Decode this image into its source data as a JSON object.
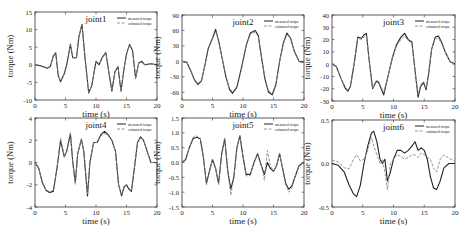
{
  "figure": {
    "legend": {
      "measured": "measured torque",
      "estimated": "estimated torque"
    },
    "colors": {
      "measured": "#222222",
      "estimated": "#8a8a8a",
      "axis": "#333333"
    }
  },
  "chart_data": [
    {
      "type": "line",
      "title": "joint1",
      "xlabel": "time (s)",
      "ylabel": "torque (Nm)",
      "xlim": [
        0,
        20
      ],
      "ylim": [
        -10,
        15
      ],
      "xticks": [
        0,
        5,
        10,
        15,
        20
      ],
      "yticks": [
        -10,
        -5,
        0,
        5,
        10,
        15
      ],
      "box": {
        "x": 35,
        "y": 12,
        "w": 122,
        "h": 88
      },
      "series": [
        {
          "name": "measured torque",
          "x": [
            0,
            1,
            2,
            2.5,
            3,
            3.4,
            3.8,
            4.2,
            4.8,
            5.2,
            5.8,
            6.2,
            6.8,
            7.2,
            7.7,
            8.2,
            8.8,
            9.3,
            10,
            10.5,
            11,
            11.6,
            12.1,
            12.6,
            13.1,
            13.6,
            14.1,
            14.6,
            15,
            15.5,
            16,
            16.5,
            17,
            17.5,
            18,
            19,
            20
          ],
          "y": [
            0,
            -0.3,
            -1,
            -0.5,
            2.5,
            3.4,
            -3,
            -4.8,
            -2.5,
            0,
            5.8,
            2,
            2,
            8,
            11.5,
            2,
            -8,
            -6,
            1,
            0,
            2,
            3.5,
            -2,
            -7.5,
            -2,
            -0.5,
            -7.5,
            -1,
            3,
            5.8,
            4,
            -3.8,
            0.5,
            1,
            0,
            0.3,
            0
          ]
        },
        {
          "name": "estimated torque",
          "x": [
            0,
            1,
            2,
            2.5,
            3,
            3.4,
            3.8,
            4.2,
            4.8,
            5.2,
            5.8,
            6.2,
            6.8,
            7.2,
            7.7,
            8.2,
            8.8,
            9.3,
            10,
            10.5,
            11,
            11.6,
            12.1,
            12.6,
            13.1,
            13.6,
            14.1,
            14.6,
            15,
            15.5,
            16,
            16.5,
            17,
            17.5,
            18,
            19,
            20
          ],
          "y": [
            0,
            -0.3,
            -0.8,
            -0.5,
            2.3,
            3.2,
            -3,
            -4.6,
            -2.5,
            0,
            5.6,
            2,
            2,
            8,
            11.3,
            2,
            -7.8,
            -6,
            1,
            0,
            2,
            3.2,
            -2,
            -7.3,
            -2,
            -0.5,
            -7.3,
            -1,
            3,
            5.6,
            4,
            -3.6,
            0.5,
            0.8,
            0,
            0.3,
            0
          ]
        }
      ]
    },
    {
      "type": "line",
      "title": "joint2",
      "xlabel": "time (s)",
      "ylabel": "torque (Nm)",
      "xlim": [
        0,
        20
      ],
      "ylim": [
        -75,
        90
      ],
      "xticks": [
        0,
        5,
        10,
        15,
        20
      ],
      "yticks": [
        -60,
        -30,
        0,
        30,
        60,
        90
      ],
      "box": {
        "x": 182,
        "y": 15,
        "w": 122,
        "h": 85
      },
      "series": [
        {
          "name": "measured torque",
          "x": [
            0,
            0.8,
            1.5,
            2,
            2.6,
            3.2,
            3.8,
            4.3,
            5,
            5.5,
            6,
            6.6,
            7.2,
            7.8,
            8.3,
            9,
            9.8,
            10.5,
            11.2,
            12,
            12.5,
            13,
            13.6,
            14.2,
            14.8,
            15.4,
            16,
            16.6,
            17.2,
            17.8,
            18.4,
            19.2,
            20
          ],
          "y": [
            0,
            -2,
            -20,
            -35,
            -45,
            -38,
            -5,
            25,
            45,
            62,
            40,
            5,
            -30,
            -55,
            -62,
            -50,
            -10,
            30,
            55,
            60,
            50,
            10,
            -35,
            -60,
            -65,
            -45,
            0,
            35,
            55,
            45,
            20,
            0,
            -2
          ]
        },
        {
          "name": "estimated torque",
          "x": [
            0,
            0.8,
            1.5,
            2,
            2.6,
            3.2,
            3.8,
            4.3,
            5,
            5.5,
            6,
            6.6,
            7.2,
            7.8,
            8.3,
            9,
            9.8,
            10.5,
            11.2,
            12,
            12.5,
            13,
            13.6,
            14.2,
            14.8,
            15.4,
            16,
            16.6,
            17.2,
            17.8,
            18.4,
            19.2,
            20
          ],
          "y": [
            0,
            -2,
            -20,
            -34,
            -43,
            -37,
            -5,
            25,
            44,
            58,
            40,
            5,
            -30,
            -53,
            -59,
            -49,
            -10,
            30,
            52,
            57,
            48,
            10,
            -34,
            -57,
            -62,
            -44,
            0,
            34,
            53,
            44,
            20,
            0,
            -2
          ]
        }
      ]
    },
    {
      "type": "line",
      "title": "joint3",
      "xlabel": "time (s)",
      "ylabel": "torque (Nm)",
      "xlim": [
        0,
        20
      ],
      "ylim": [
        -30,
        40
      ],
      "xticks": [
        0,
        5,
        10,
        15,
        20
      ],
      "yticks": [
        -30,
        -20,
        -10,
        0,
        10,
        20,
        30,
        40
      ],
      "box": {
        "x": 332,
        "y": 15,
        "w": 123,
        "h": 86
      },
      "series": [
        {
          "name": "measured torque",
          "x": [
            0,
            0.7,
            1.5,
            2.2,
            2.6,
            3,
            3.6,
            4.2,
            4.8,
            5.2,
            5.6,
            6,
            6.6,
            7.2,
            7.6,
            8,
            8.4,
            9,
            9.8,
            10.5,
            11.2,
            11.8,
            12.4,
            13,
            13.5,
            14,
            14.4,
            14.9,
            15.3,
            15.7,
            16.2,
            16.8,
            17.3,
            17.8,
            18.4,
            19.2,
            20
          ],
          "y": [
            0,
            -2,
            -12,
            -20,
            -22,
            -18,
            0,
            22,
            21,
            24,
            25,
            5,
            -20,
            -14,
            -15,
            -20,
            -25,
            -12,
            5,
            16,
            22,
            25,
            20,
            18,
            -5,
            -27,
            -18,
            -15,
            -21,
            -8,
            12,
            22,
            23,
            18,
            10,
            2,
            0
          ]
        },
        {
          "name": "estimated torque",
          "x": [
            0,
            0.7,
            1.5,
            2.2,
            2.6,
            3,
            3.6,
            4.2,
            4.8,
            5.2,
            5.6,
            6,
            6.6,
            7.2,
            7.6,
            8,
            8.4,
            9,
            9.8,
            10.5,
            11.2,
            11.8,
            12.4,
            13,
            13.5,
            14,
            14.4,
            14.9,
            15.3,
            15.7,
            16.2,
            16.8,
            17.3,
            17.8,
            18.4,
            19.2,
            20
          ],
          "y": [
            0,
            -2,
            -12,
            -19,
            -21,
            -18,
            0,
            21,
            20,
            22,
            23,
            5,
            -20,
            -13,
            -14,
            -19,
            -23,
            -12,
            5,
            15,
            20,
            23,
            19,
            17,
            -5,
            -25,
            -17,
            -14,
            -20,
            -8,
            12,
            21,
            21,
            17,
            10,
            2,
            0
          ]
        }
      ]
    },
    {
      "type": "line",
      "title": "joint4",
      "xlabel": "time (s)",
      "ylabel": "torque (Nm)",
      "xlim": [
        0,
        20
      ],
      "ylim": [
        -4,
        4
      ],
      "xticks": [
        0,
        5,
        10,
        15,
        20
      ],
      "yticks": [
        -4,
        -2,
        0,
        2,
        4
      ],
      "box": {
        "x": 35,
        "y": 118,
        "w": 122,
        "h": 89
      },
      "series": [
        {
          "name": "measured torque",
          "x": [
            0,
            0.6,
            1.2,
            1.8,
            2.4,
            3,
            3.6,
            4.2,
            4.8,
            5.2,
            5.8,
            6.2,
            6.6,
            7,
            7.6,
            8,
            8.6,
            9,
            9.6,
            10.2,
            10.8,
            11.4,
            12,
            12.6,
            13.2,
            13.7,
            14.2,
            14.6,
            15,
            15.4,
            15.8,
            16.3,
            16.8,
            17.3,
            17.8,
            18.4,
            19,
            20
          ],
          "y": [
            0,
            -0.5,
            -1.8,
            -2.5,
            -2.7,
            -2.6,
            -0.5,
            2,
            0.5,
            1,
            2.6,
            0,
            -1.8,
            0.8,
            2.1,
            1,
            -3,
            0,
            1.8,
            1.8,
            2.5,
            2.8,
            2.5,
            2,
            1,
            -2,
            -3,
            -2.2,
            -2,
            -2.4,
            -2.6,
            -0.5,
            1.8,
            2.3,
            2,
            1,
            0,
            0
          ]
        },
        {
          "name": "estimated torque",
          "x": [
            0,
            0.6,
            1.2,
            1.8,
            2.4,
            3,
            3.6,
            4.2,
            4.8,
            5.2,
            5.8,
            6.2,
            6.6,
            7,
            7.6,
            8,
            8.6,
            9,
            9.6,
            10.2,
            10.8,
            11.4,
            12,
            12.6,
            13.2,
            13.7,
            14.2,
            14.6,
            15,
            15.4,
            15.8,
            16.3,
            16.8,
            17.3,
            17.8,
            18.4,
            19,
            20
          ],
          "y": [
            0,
            -0.5,
            -1.8,
            -2.5,
            -2.6,
            -2.5,
            -0.5,
            2.2,
            0.5,
            1,
            2.7,
            0,
            -2,
            0.8,
            2.1,
            1,
            -2.8,
            0,
            1.8,
            1.8,
            2.4,
            2.6,
            2.4,
            2,
            1,
            -2,
            -2.9,
            -2.1,
            -2,
            -2.3,
            -2.5,
            -0.5,
            1.8,
            2.2,
            2,
            1,
            0,
            0
          ]
        }
      ]
    },
    {
      "type": "line",
      "title": "joint5",
      "xlabel": "time (s)",
      "ylabel": "torque (Nm)",
      "xlim": [
        0,
        20
      ],
      "ylim": [
        -1.5,
        1.5
      ],
      "xticks": [
        0,
        5,
        10,
        15,
        20
      ],
      "yticks": [
        -1.5,
        -1.0,
        -0.5,
        0.0,
        0.5,
        1.0,
        1.5
      ],
      "box": {
        "x": 182,
        "y": 118,
        "w": 122,
        "h": 89
      },
      "series": [
        {
          "name": "measured torque",
          "x": [
            0,
            0.6,
            1.2,
            1.8,
            2.4,
            3,
            3.5,
            4,
            4.5,
            5,
            5.5,
            6,
            6.5,
            7,
            7.5,
            8,
            8.5,
            9,
            9.5,
            10,
            10.5,
            11.2,
            11.8,
            12.4,
            13,
            13.5,
            14,
            14.5,
            15,
            15.5,
            16,
            16.5,
            17,
            17.5,
            18,
            18.5,
            19.2,
            20
          ],
          "y": [
            0,
            0.1,
            0.5,
            0.8,
            0.85,
            0.8,
            0.2,
            -0.7,
            -0.3,
            0.1,
            -0.2,
            -0.7,
            0.3,
            0.8,
            -0.3,
            -0.9,
            -0.5,
            0.5,
            0.9,
            0.2,
            -0.4,
            -0.4,
            0,
            0.3,
            -0.1,
            -0.4,
            0,
            -0.2,
            -0.3,
            -0.1,
            0.3,
            -0.2,
            -0.7,
            -0.9,
            -0.8,
            -0.5,
            -0.1,
            0
          ]
        },
        {
          "name": "estimated torque",
          "x": [
            0,
            0.6,
            1.2,
            1.8,
            2.4,
            3,
            3.5,
            4,
            4.5,
            5,
            5.5,
            6,
            6.5,
            7,
            7.5,
            8,
            8.5,
            9,
            9.5,
            10,
            10.5,
            11.2,
            11.8,
            12.4,
            13,
            13.5,
            14,
            14.5,
            15,
            15.5,
            16,
            16.5,
            17,
            17.5,
            18,
            18.5,
            19.2,
            20
          ],
          "y": [
            0,
            0.1,
            0.5,
            0.85,
            0.9,
            0.8,
            0.2,
            -0.75,
            -0.3,
            0.1,
            -0.2,
            -0.75,
            0.3,
            0.8,
            -0.3,
            -1.1,
            -0.5,
            0.5,
            0.9,
            0.2,
            -0.45,
            -0.45,
            0,
            0.3,
            -0.1,
            -0.6,
            0.4,
            -0.1,
            -0.3,
            -0.1,
            0.3,
            -0.2,
            -0.75,
            -1.0,
            -0.85,
            -0.5,
            -0.1,
            0
          ]
        }
      ]
    },
    {
      "type": "line",
      "title": "joint6",
      "xlabel": "time (s)",
      "ylabel": "torque (Nm)",
      "xlim": [
        0,
        20
      ],
      "ylim": [
        -0.5,
        0.5
      ],
      "xticks": [
        0,
        5,
        10,
        15,
        20
      ],
      "yticks": [
        -0.5,
        0.0,
        0.5
      ],
      "box": {
        "x": 332,
        "y": 120,
        "w": 123,
        "h": 87
      },
      "series": [
        {
          "name": "measured torque",
          "x": [
            0,
            1,
            2,
            2.8,
            3.5,
            4,
            4.6,
            5.2,
            5.8,
            6.4,
            6.8,
            7.3,
            7.8,
            8.2,
            8.6,
            9,
            9.5,
            10,
            10.6,
            11.2,
            11.8,
            12.4,
            13,
            13.5,
            14,
            14.5,
            15,
            15.5,
            16,
            16.5,
            17,
            17.6,
            18.2,
            19,
            20
          ],
          "y": [
            0,
            -0.02,
            -0.1,
            -0.25,
            -0.35,
            -0.38,
            -0.25,
            0,
            0.2,
            0.35,
            0.37,
            0.25,
            0.05,
            0,
            0.05,
            -0.2,
            -0.1,
            0.05,
            0.15,
            0.15,
            0.12,
            0.15,
            0.2,
            0.25,
            0.15,
            0.18,
            0.15,
            0.05,
            -0.15,
            -0.28,
            -0.3,
            -0.2,
            -0.05,
            0,
            0
          ]
        },
        {
          "name": "estimated torque",
          "x": [
            0,
            1,
            2,
            2.8,
            3.5,
            4,
            4.6,
            5.2,
            5.8,
            6.4,
            6.8,
            7.3,
            7.8,
            8.2,
            8.6,
            9,
            9.5,
            10,
            10.6,
            11.2,
            11.8,
            12.4,
            13,
            13.5,
            14,
            14.5,
            15,
            15.5,
            16,
            16.5,
            17,
            17.6,
            18.2,
            19,
            20
          ],
          "y": [
            0.04,
            0.02,
            -0.05,
            -0.06,
            0.05,
            0.1,
            0.03,
            0.05,
            0.15,
            0.3,
            0.2,
            0.1,
            0,
            0.05,
            -0.1,
            -0.3,
            0,
            0.05,
            0.1,
            0.08,
            0.05,
            0.07,
            0.1,
            0.1,
            0.07,
            0.12,
            0.1,
            0.07,
            0.05,
            -0.05,
            -0.1,
            0.05,
            0.1,
            0.06,
            0.03
          ]
        }
      ]
    }
  ]
}
